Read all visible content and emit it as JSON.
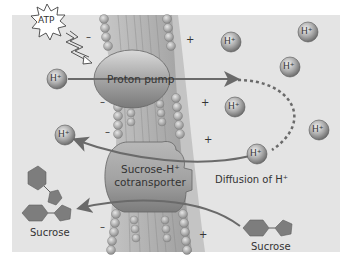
{
  "diagram": {
    "colors": {
      "panel": "#e4e4e4",
      "protein": "#9a9a9a",
      "arrow": "#6a6a6a",
      "hexagon": "#7d7d7d",
      "ion": "#a6a6a6",
      "membrane_head": "#b9b9b9"
    },
    "labels": {
      "atp": "ATP",
      "proton_pump": "Proton pump",
      "cotransporter_line1": "Sucrose-H⁺",
      "cotransporter_line2": "cotransporter",
      "diffusion": "Diffusion of H⁺",
      "sucrose_left": "Sucrose",
      "sucrose_right": "Sucrose"
    },
    "ion_label": "H⁺",
    "charges": {
      "minus": "–",
      "plus": "+"
    },
    "ions": [
      {
        "name": "h-ion-pump-input",
        "x": 57,
        "y": 79
      },
      {
        "name": "h-ion-released-left",
        "x": 65,
        "y": 135
      },
      {
        "name": "h-ion-top-1",
        "x": 231,
        "y": 42
      },
      {
        "name": "h-ion-top-right",
        "x": 308,
        "y": 32
      },
      {
        "name": "h-ion-mid-right",
        "x": 290,
        "y": 67
      },
      {
        "name": "h-ion-mid",
        "x": 235,
        "y": 107
      },
      {
        "name": "h-ion-far-right",
        "x": 319,
        "y": 130
      },
      {
        "name": "h-ion-diffusing",
        "x": 257,
        "y": 154
      }
    ],
    "minus_signs": [
      {
        "x": 86,
        "y": 36
      },
      {
        "x": 100,
        "y": 101
      },
      {
        "x": 105,
        "y": 131
      },
      {
        "x": 100,
        "y": 226
      }
    ],
    "plus_signs": [
      {
        "x": 188,
        "y": 40
      },
      {
        "x": 202,
        "y": 103
      },
      {
        "x": 205,
        "y": 140
      },
      {
        "x": 200,
        "y": 234
      }
    ]
  }
}
